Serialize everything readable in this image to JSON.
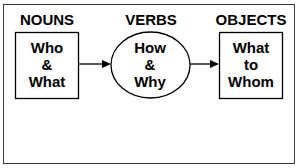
{
  "diagram": {
    "columns": [
      {
        "heading": "NOUNS",
        "shape": "rectangle",
        "lines": [
          "Who",
          "&",
          "What"
        ]
      },
      {
        "heading": "VERBS",
        "shape": "ellipse",
        "lines": [
          "How",
          "&",
          "Why"
        ]
      },
      {
        "heading": "OBJECTS",
        "shape": "rectangle",
        "lines": [
          "What",
          "to",
          "Whom"
        ]
      }
    ],
    "arrows": [
      {
        "from": "NOUNS",
        "to": "VERBS"
      },
      {
        "from": "VERBS",
        "to": "OBJECTS"
      }
    ],
    "colors": {
      "stroke": "#000000",
      "background": "#ffffff"
    }
  }
}
